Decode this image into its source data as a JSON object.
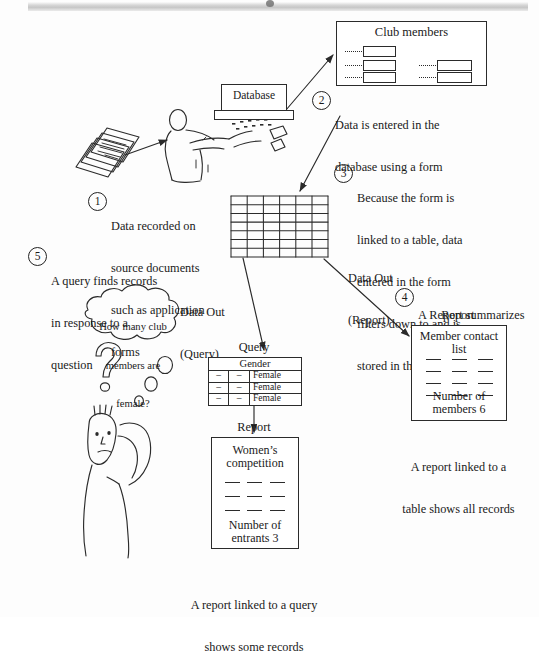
{
  "diagram": {
    "title_hidden": "Database flow: form, table, query, report",
    "ink_color": "#2b2b2b",
    "page_color": "#fdfdfd"
  },
  "form_box": {
    "title": "Club members",
    "field_rows": 3
  },
  "monitor": {
    "label": "Database"
  },
  "callouts": [
    {
      "number": "1",
      "lines": [
        "Data recorded on",
        "source documents",
        "such as application",
        "forms"
      ]
    },
    {
      "number": "2",
      "lines": [
        "Data is entered in the",
        "database using a form"
      ]
    },
    {
      "number": "3",
      "lines": [
        "Because the form is",
        "linked to a table, data",
        "entered in the form",
        "filters down to and is",
        "stored in the table"
      ]
    },
    {
      "number": "4",
      "lines": [
        "A Report summarizes",
        "and formats data"
      ]
    },
    {
      "number": "5",
      "lines": [
        "A query finds records",
        "in response to a",
        "question"
      ]
    }
  ],
  "thought_bubble": {
    "lines": [
      "How many club",
      "members are",
      "female?"
    ]
  },
  "flow_labels": {
    "data_out_query": [
      "Data Out",
      "(Query)"
    ],
    "data_out_report": [
      "Data Out",
      "(Report)"
    ],
    "query_caption": "Query",
    "report_left_caption": "Report",
    "report_right_caption": "Report"
  },
  "query_table": {
    "header": "Gender",
    "rows": [
      {
        "c1": "–",
        "c2": "–",
        "c3": "Female"
      },
      {
        "c1": "–",
        "c2": "–",
        "c3": "Female"
      },
      {
        "c1": "–",
        "c2": "–",
        "c3": "Female"
      }
    ]
  },
  "report_left": {
    "title_lines": [
      "Women’s",
      "competition"
    ],
    "dash_rows": 3,
    "dashes_per_row": 3,
    "footer_lines": [
      "Number of",
      "entrants 3"
    ],
    "caption_lines": [
      "A report linked to a query",
      "shows some records"
    ]
  },
  "report_right": {
    "title_lines": [
      "Member contact",
      "list"
    ],
    "dash_rows": 4,
    "dashes_per_row": 3,
    "footer_lines": [
      "Number of",
      "members 6"
    ],
    "caption_lines": [
      "A report linked to a",
      "table shows all records"
    ]
  },
  "main_table": {
    "columns": 6,
    "rows": 7
  }
}
